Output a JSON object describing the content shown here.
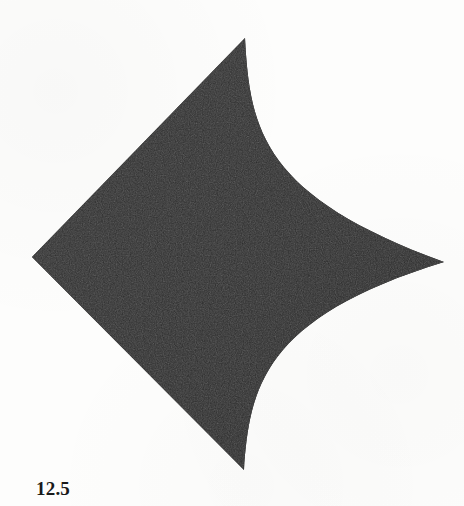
{
  "page": {
    "background_color": "#fdfdfc",
    "width": 464,
    "height": 506
  },
  "figure": {
    "caption": "12.5",
    "caption_position": "bottom-left",
    "shape_name": "concave-kite-astroid-quadrant",
    "fill_color": "#2e2e2e",
    "fill_color_shade_dark": "#242424",
    "fill_color_shade_light": "#3a3a3a",
    "stroke_color": "#2a2a2a",
    "vertices": {
      "top_cusp": {
        "x": 245,
        "y": 38,
        "label": "top-cusp"
      },
      "left_vertex": {
        "x": 32,
        "y": 257,
        "label": "left-vertex"
      },
      "right_cusp": {
        "x": 444,
        "y": 262,
        "label": "right-cusp"
      },
      "bottom_cusp": {
        "x": 244,
        "y": 470,
        "label": "bottom-cusp"
      }
    },
    "edges": [
      {
        "name": "upper-left-edge",
        "type": "straight",
        "from": "left_vertex",
        "to": "top_cusp"
      },
      {
        "name": "upper-right-edge",
        "type": "concave-arc",
        "from": "top_cusp",
        "to": "right_cusp",
        "control": {
          "x": 286,
          "y": 214
        }
      },
      {
        "name": "lower-right-edge",
        "type": "concave-arc",
        "from": "right_cusp",
        "to": "bottom_cusp",
        "control": {
          "x": 288,
          "y": 310
        }
      },
      {
        "name": "lower-left-edge",
        "type": "straight",
        "from": "bottom_cusp",
        "to": "left_vertex"
      }
    ],
    "svg_path": "M 32 257 L 245 38 C 250 132 264 196 444 262 C 262 318 250 388 244 470 Z"
  }
}
